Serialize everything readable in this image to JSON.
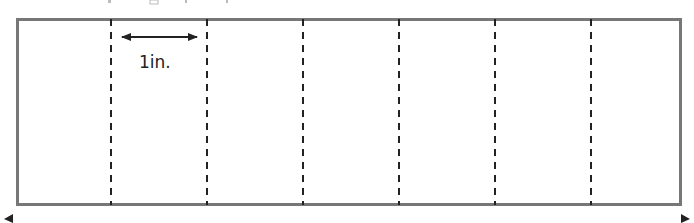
{
  "diagram": {
    "type": "paper strip folded into equal sections",
    "strip": {
      "x": 16,
      "y": 18,
      "width": 666,
      "height": 188,
      "border_color": "#777777",
      "border_width": 3
    },
    "fold_lines": {
      "style": "dashed",
      "color": "#222222",
      "x_positions": [
        111,
        207,
        303,
        399,
        495,
        591
      ],
      "count": 6
    },
    "sections": 7,
    "measurement": {
      "label": "1in.",
      "arrow": {
        "x1": 122,
        "x2": 197,
        "y": 37,
        "style": "double-headed"
      },
      "label_x": 159,
      "label_y": 63
    },
    "bottom_arrow": {
      "style": "double-headed, cropped",
      "left_tip_x": 4,
      "right_tip_x": 690,
      "y": 219
    }
  }
}
